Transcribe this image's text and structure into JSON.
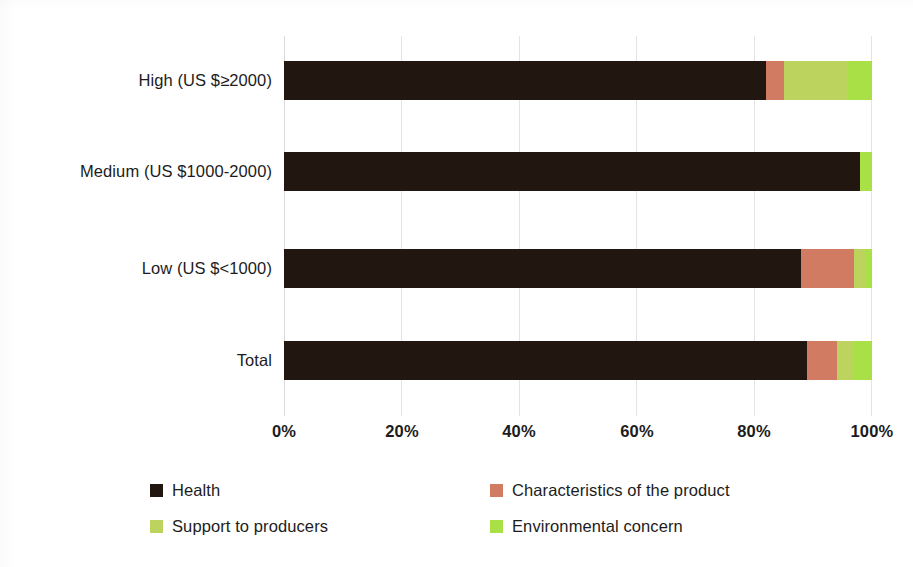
{
  "chart_data": {
    "type": "bar",
    "orientation": "horizontal",
    "stacked": true,
    "stack_mode": "percent",
    "title": "",
    "subtitle": "",
    "xlabel": "",
    "ylabel": "",
    "xlim": [
      0,
      100
    ],
    "xticks": [
      "0%",
      "20%",
      "40%",
      "60%",
      "80%",
      "100%"
    ],
    "xtick_values": [
      0,
      20,
      40,
      60,
      80,
      100
    ],
    "grid": true,
    "grid_axis": "x",
    "legend_position": "bottom",
    "categories": [
      "High (US $≥2000)",
      "Medium (US $1000-2000)",
      "Low (US $<1000)",
      "Total"
    ],
    "series": [
      {
        "name": "Health",
        "color": "#221610",
        "values": [
          82,
          98,
          88,
          89
        ]
      },
      {
        "name": "Characteristics of the product",
        "color": "#d07b62",
        "values": [
          3,
          0,
          9,
          5
        ]
      },
      {
        "name": "Support to producers",
        "color": "#bcd45e",
        "values": [
          11,
          0,
          2,
          3
        ]
      },
      {
        "name": "Environmental concern",
        "color": "#a9e046",
        "values": [
          4,
          2,
          1,
          3
        ]
      }
    ]
  },
  "axis": {
    "x_tick_labels": [
      "0%",
      "20%",
      "40%",
      "60%",
      "80%",
      "100%"
    ],
    "category_labels": [
      "High (US $≥2000)",
      "Medium (US $1000-2000)",
      "Low (US $<1000)",
      "Total"
    ]
  },
  "legend": {
    "items": [
      {
        "label": "Health",
        "color": "#221610"
      },
      {
        "label": "Characteristics of the product",
        "color": "#d07b62"
      },
      {
        "label": "Support to producers",
        "color": "#bcd45e"
      },
      {
        "label": "Environmental concern",
        "color": "#a9e046"
      }
    ]
  },
  "colors": {
    "health": "#221610",
    "characteristics": "#d07b62",
    "support": "#bcd45e",
    "environmental": "#a9e046",
    "grid": "#e4e4e4",
    "text": "#1c1c1c",
    "background": "#ffffff"
  }
}
